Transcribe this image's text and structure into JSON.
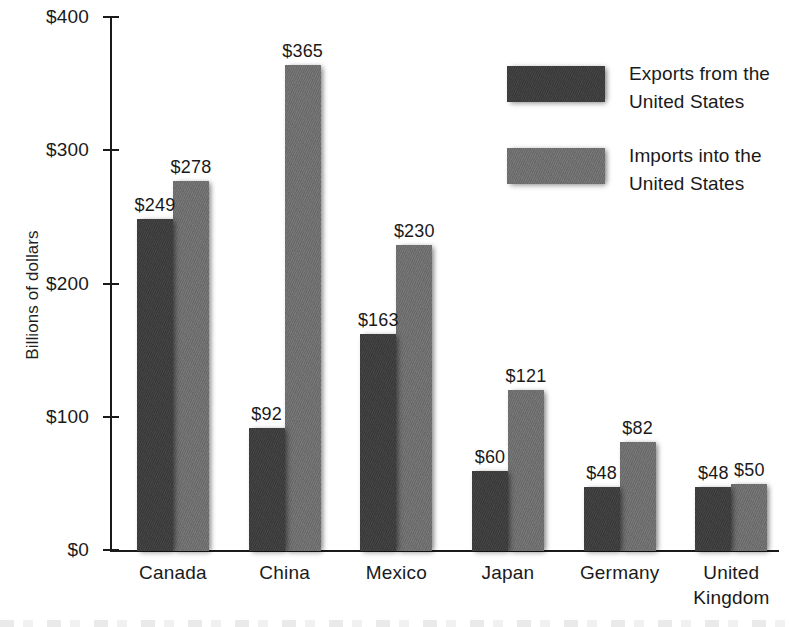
{
  "chart_data": {
    "type": "bar",
    "title": "",
    "xlabel": "",
    "ylabel": "Billions of dollars",
    "ylim": [
      0,
      400
    ],
    "yticks": [
      0,
      100,
      200,
      300,
      400
    ],
    "ytick_labels": [
      "$0",
      "$100",
      "$200",
      "$300",
      "$400"
    ],
    "grid": false,
    "legend_position": "upper right",
    "categories": [
      "Canada",
      "China",
      "Mexico",
      "Japan",
      "Germany",
      "United Kingdom"
    ],
    "category_lines": [
      [
        "Canada"
      ],
      [
        "China"
      ],
      [
        "Mexico"
      ],
      [
        "Japan"
      ],
      [
        "Germany"
      ],
      [
        "United",
        "Kingdom"
      ]
    ],
    "series": [
      {
        "name": "Exports from the United States",
        "color": "#3c3c3c",
        "values": [
          249,
          92,
          163,
          60,
          48,
          48
        ],
        "value_labels": [
          "$249",
          "$92",
          "$163",
          "$60",
          "$48",
          "$48"
        ]
      },
      {
        "name": "Imports into the United States",
        "color": "#6f6f6f",
        "values": [
          278,
          365,
          230,
          121,
          82,
          50
        ],
        "value_labels": [
          "$278",
          "$365",
          "$230",
          "$121",
          "$82",
          "$50"
        ]
      }
    ]
  },
  "legend": {
    "items": [
      {
        "label": "Exports from the\nUnited States",
        "series": "exports"
      },
      {
        "label": "Imports into the\nUnited States",
        "series": "imports"
      }
    ]
  },
  "axis": {
    "y_title": "Billions of dollars"
  }
}
